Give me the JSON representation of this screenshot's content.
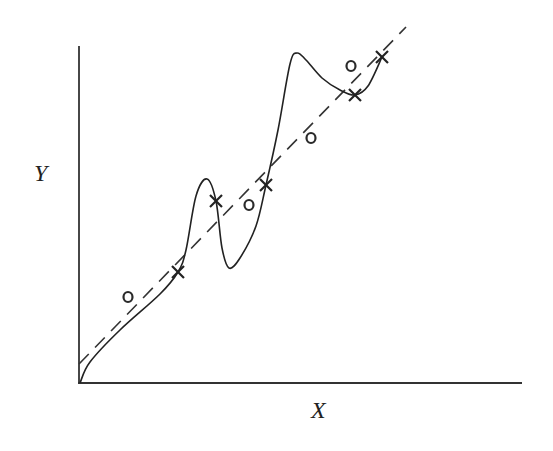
{
  "chart_data": {
    "type": "line",
    "title": "",
    "xlabel": "X",
    "ylabel": "Y",
    "grid": false,
    "legend": null,
    "axes": {
      "origin_px": [
        79,
        383
      ],
      "x_end_px": [
        522,
        383
      ],
      "y_end_px": [
        79,
        46
      ],
      "ticks": "none"
    },
    "series": [
      {
        "name": "fitted-curve",
        "style": "solid",
        "description": "Overfit wiggly curve through the x training points",
        "points_px": [
          [
            80,
            383
          ],
          [
            90,
            362
          ],
          [
            120,
            330
          ],
          [
            160,
            294
          ],
          [
            178,
            272
          ],
          [
            186,
            250
          ],
          [
            196,
            196
          ],
          [
            207,
            179
          ],
          [
            216,
            201
          ],
          [
            222,
            248
          ],
          [
            229,
            268
          ],
          [
            240,
            258
          ],
          [
            256,
            226
          ],
          [
            266,
            185
          ],
          [
            278,
            130
          ],
          [
            290,
            64
          ],
          [
            297,
            53
          ],
          [
            306,
            60
          ],
          [
            322,
            78
          ],
          [
            340,
            90
          ],
          [
            355,
            95
          ],
          [
            368,
            86
          ],
          [
            382,
            57
          ]
        ]
      },
      {
        "name": "linear-fit",
        "style": "dashed",
        "description": "Straight-line regression",
        "points_px": [
          [
            79,
            364
          ],
          [
            406,
            27
          ]
        ]
      }
    ],
    "markers": {
      "x_points": [
        [
          178,
          272
        ],
        [
          216,
          201
        ],
        [
          266,
          185
        ],
        [
          355,
          95
        ],
        [
          382,
          57
        ]
      ],
      "o_points": [
        [
          128,
          297
        ],
        [
          249,
          205
        ],
        [
          311,
          138
        ],
        [
          351,
          66
        ]
      ]
    },
    "labels": {
      "x": "X",
      "y": "Y",
      "o_glyph": "o",
      "x_glyph": "×"
    }
  }
}
